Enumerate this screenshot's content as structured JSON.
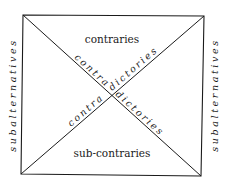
{
  "diagram": {
    "labels": {
      "top": "contraries",
      "bottom": "sub-contraries",
      "left": "subalternatives",
      "right": "subalternatives",
      "diag_tl_br_part1": "contra",
      "diag_tl_br_part2": "dictories",
      "diag_bl_tr_part1": "contra",
      "diag_bl_tr_part2": "dictories"
    },
    "colors": {
      "line": "#1a1a1a",
      "background": "#ffffff"
    }
  }
}
